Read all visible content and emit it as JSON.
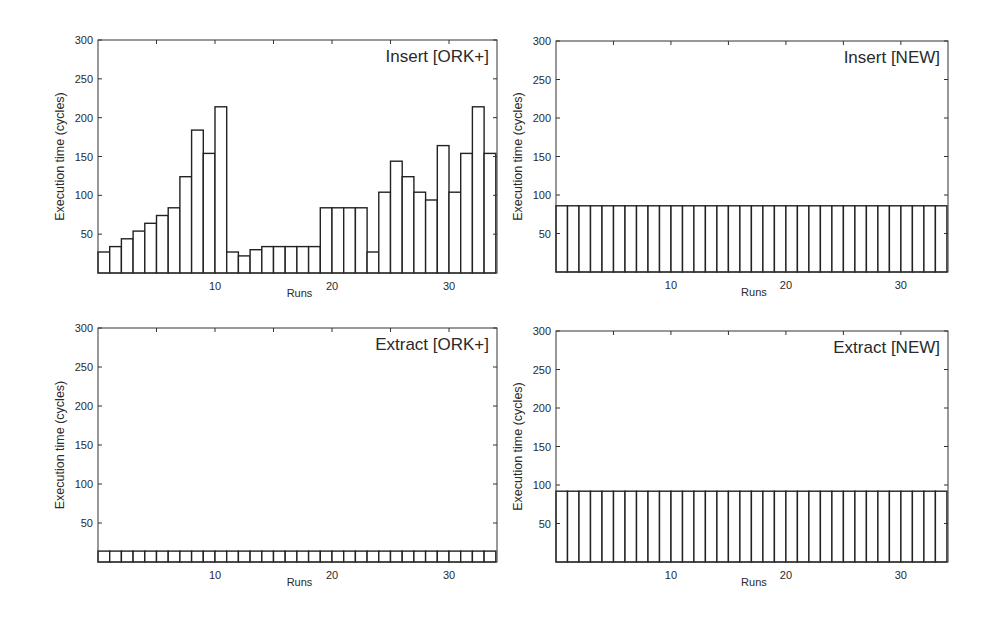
{
  "chart_data": [
    {
      "type": "bar",
      "title": "Insert [ORK+]",
      "xlabel": "Runs",
      "ylabel": "Execution time (cycles)",
      "ylim": [
        0,
        300
      ],
      "yticks": [
        50,
        100,
        150,
        200,
        250,
        300
      ],
      "xticks": [
        10,
        20,
        30
      ],
      "grid": false,
      "categories": [
        1,
        2,
        3,
        4,
        5,
        6,
        7,
        8,
        9,
        10,
        11,
        12,
        13,
        14,
        15,
        16,
        17,
        18,
        19,
        20,
        21,
        22,
        23,
        24,
        25,
        26,
        27,
        28,
        29,
        30,
        31,
        32,
        33,
        34
      ],
      "values": [
        27,
        34,
        44,
        54,
        64,
        74,
        84,
        124,
        184,
        154,
        214,
        27,
        22,
        30,
        34,
        34,
        34,
        34,
        34,
        84,
        84,
        84,
        84,
        27,
        104,
        144,
        124,
        104,
        94,
        164,
        104,
        154,
        214,
        154
      ]
    },
    {
      "type": "bar",
      "title": "Insert [NEW]",
      "xlabel": "Runs",
      "ylabel": "Execution time (cycles)",
      "ylim": [
        0,
        300
      ],
      "yticks": [
        50,
        100,
        150,
        200,
        250,
        300
      ],
      "xticks": [
        10,
        20,
        30
      ],
      "grid": false,
      "categories": [
        1,
        2,
        3,
        4,
        5,
        6,
        7,
        8,
        9,
        10,
        11,
        12,
        13,
        14,
        15,
        16,
        17,
        18,
        19,
        20,
        21,
        22,
        23,
        24,
        25,
        26,
        27,
        28,
        29,
        30,
        31,
        32,
        33,
        34
      ],
      "values": [
        86,
        86,
        86,
        86,
        86,
        86,
        86,
        86,
        86,
        86,
        86,
        86,
        86,
        86,
        86,
        86,
        86,
        86,
        86,
        86,
        86,
        86,
        86,
        86,
        86,
        86,
        86,
        86,
        86,
        86,
        86,
        86,
        86,
        86
      ]
    },
    {
      "type": "bar",
      "title": "Extract [ORK+]",
      "xlabel": "Runs",
      "ylabel": "Execution time (cycles)",
      "ylim": [
        0,
        300
      ],
      "yticks": [
        50,
        100,
        150,
        200,
        250,
        300
      ],
      "xticks": [
        10,
        20,
        30
      ],
      "grid": false,
      "categories": [
        1,
        2,
        3,
        4,
        5,
        6,
        7,
        8,
        9,
        10,
        11,
        12,
        13,
        14,
        15,
        16,
        17,
        18,
        19,
        20,
        21,
        22,
        23,
        24,
        25,
        26,
        27,
        28,
        29,
        30,
        31,
        32,
        33,
        34
      ],
      "values": [
        14,
        14,
        14,
        14,
        14,
        14,
        14,
        14,
        14,
        14,
        14,
        14,
        14,
        14,
        14,
        14,
        14,
        14,
        14,
        14,
        14,
        14,
        14,
        14,
        14,
        14,
        14,
        14,
        14,
        14,
        14,
        14,
        14,
        14
      ]
    },
    {
      "type": "bar",
      "title": "Extract [NEW]",
      "xlabel": "Runs",
      "ylabel": "Execution time (cycles)",
      "ylim": [
        0,
        300
      ],
      "yticks": [
        50,
        100,
        150,
        200,
        250,
        300
      ],
      "xticks": [
        10,
        20,
        30
      ],
      "grid": false,
      "categories": [
        1,
        2,
        3,
        4,
        5,
        6,
        7,
        8,
        9,
        10,
        11,
        12,
        13,
        14,
        15,
        16,
        17,
        18,
        19,
        20,
        21,
        22,
        23,
        24,
        25,
        26,
        27,
        28,
        29,
        30,
        31,
        32,
        33,
        34
      ],
      "values": [
        92,
        92,
        92,
        92,
        92,
        92,
        92,
        92,
        92,
        92,
        92,
        92,
        92,
        92,
        92,
        92,
        92,
        92,
        92,
        92,
        92,
        92,
        92,
        92,
        92,
        92,
        92,
        92,
        92,
        92,
        92,
        92,
        92,
        92
      ]
    }
  ],
  "style": {
    "bar_fill": "#ffffff",
    "bar_stroke": "#222222",
    "frame_stroke": "#333333",
    "background": "#ffffff"
  }
}
